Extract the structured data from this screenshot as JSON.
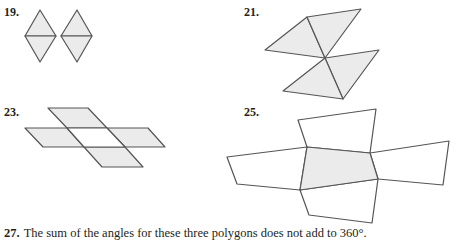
{
  "exercises": [
    {
      "number": "19.",
      "figure": "two-rhombi-each-split-into-two-triangles"
    },
    {
      "number": "21.",
      "figure": "four-triangles-meeting-at-vertex"
    },
    {
      "number": "23.",
      "figure": "parallelogram-cross-tiling"
    },
    {
      "number": "25.",
      "figure": "quadrilateral-with-four-adjacent-quadrilaterals"
    }
  ],
  "answer27": {
    "number": "27.",
    "text": "The sum of the angles for these three polygons does not add to 360°."
  },
  "colors": {
    "fill": "#ebebeb",
    "stroke": "#555555"
  }
}
